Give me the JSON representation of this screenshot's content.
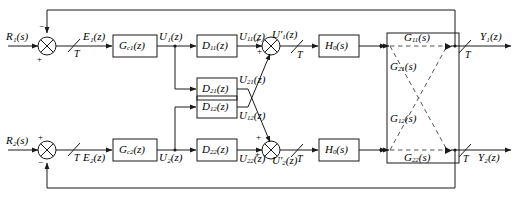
{
  "diagram": {
    "line_color": "#1a1a1a",
    "dashed_color": "#555555",
    "background": "#ffffff"
  },
  "inputs": [
    {
      "name": "reference-1",
      "label": "R₁(s)"
    },
    {
      "name": "reference-2",
      "label": "R₂(s)"
    }
  ],
  "outputs": [
    {
      "name": "output-1",
      "label": "Y₁(z)"
    },
    {
      "name": "output-2",
      "label": "Y₂(z)"
    }
  ],
  "errors": [
    {
      "name": "error-1",
      "label": "E₁(z)"
    },
    {
      "name": "error-2",
      "label": "E₂(z)"
    }
  ],
  "controllers": [
    {
      "name": "controller-1",
      "label": "Gᶜ₁(z)",
      "base": "G",
      "sub": "c1",
      "arg": "(z)"
    },
    {
      "name": "controller-2",
      "label": "Gᶜ₂(z)",
      "base": "G",
      "sub": "c2",
      "arg": "(z)"
    }
  ],
  "control_signals": [
    {
      "name": "control-signal-1",
      "label": "U₁(z)"
    },
    {
      "name": "control-signal-2",
      "label": "U₂(z)"
    }
  ],
  "decouplers": [
    {
      "name": "decoupler-d11",
      "base": "D",
      "sub": "11",
      "arg": "(z)"
    },
    {
      "name": "decoupler-d21",
      "base": "D",
      "sub": "21",
      "arg": "(z)"
    },
    {
      "name": "decoupler-d12",
      "base": "D",
      "sub": "12",
      "arg": "(z)"
    },
    {
      "name": "decoupler-d22",
      "base": "D",
      "sub": "22",
      "arg": "(z)"
    }
  ],
  "decoupler_outputs": [
    {
      "name": "signal-u11",
      "base": "U",
      "sub": "11",
      "arg": "(z)"
    },
    {
      "name": "signal-u21",
      "base": "U",
      "sub": "21",
      "arg": "(z)"
    },
    {
      "name": "signal-u12",
      "base": "U",
      "sub": "12",
      "arg": "(z)"
    },
    {
      "name": "signal-u22",
      "base": "U",
      "sub": "22",
      "arg": "(z)"
    }
  ],
  "summed_signals": [
    {
      "name": "summed-signal-1",
      "base": "U′",
      "sub": "1",
      "arg": "(z)"
    },
    {
      "name": "summed-signal-2",
      "base": "U′",
      "sub": "2",
      "arg": "(z)"
    }
  ],
  "holds": [
    {
      "name": "zero-order-hold-1",
      "base": "H",
      "sub": "0",
      "arg": "(s)"
    },
    {
      "name": "zero-order-hold-2",
      "base": "H",
      "sub": "0",
      "arg": "(s)"
    }
  ],
  "plant": {
    "name": "plant-block",
    "transfer_functions": [
      {
        "name": "plant-g11",
        "base": "G",
        "sub": "11",
        "arg": "(s)",
        "path": "direct-upper"
      },
      {
        "name": "plant-g21",
        "base": "G",
        "sub": "21",
        "arg": "(s)",
        "path": "cross-upper-to-lower"
      },
      {
        "name": "plant-g12",
        "base": "G",
        "sub": "12",
        "arg": "(s)",
        "path": "cross-lower-to-upper"
      },
      {
        "name": "plant-g22",
        "base": "G",
        "sub": "22",
        "arg": "(s)",
        "path": "direct-lower"
      }
    ]
  },
  "samplers": [
    {
      "name": "sampler-input-1",
      "label": "T"
    },
    {
      "name": "sampler-input-2",
      "label": "T"
    },
    {
      "name": "sampler-mid-1",
      "label": "T"
    },
    {
      "name": "sampler-mid-2",
      "label": "T"
    },
    {
      "name": "sampler-output-1",
      "label": "T"
    },
    {
      "name": "sampler-output-2",
      "label": "T"
    }
  ],
  "summing_junctions": [
    {
      "name": "summing-junction-input-1",
      "signs": [
        {
          "name": "sign-reference-positive",
          "symbol": "+"
        },
        {
          "name": "sign-feedback-negative",
          "symbol": "−"
        }
      ]
    },
    {
      "name": "summing-junction-input-2",
      "signs": [
        {
          "name": "sign-reference-positive",
          "symbol": "+"
        },
        {
          "name": "sign-feedback-negative",
          "symbol": "−"
        }
      ]
    },
    {
      "name": "summing-junction-decouple-1",
      "signs": [
        {
          "name": "sign-direct-positive",
          "symbol": "+"
        },
        {
          "name": "sign-cross-positive",
          "symbol": "+"
        }
      ]
    },
    {
      "name": "summing-junction-decouple-2",
      "signs": [
        {
          "name": "sign-cross-positive",
          "symbol": "+"
        },
        {
          "name": "sign-direct-positive",
          "symbol": "+"
        }
      ]
    }
  ]
}
